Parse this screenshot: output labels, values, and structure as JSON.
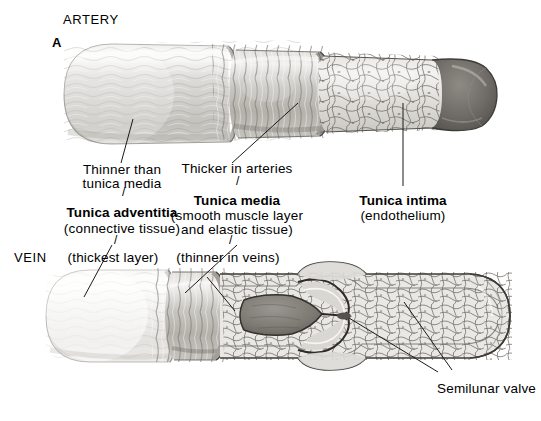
{
  "figure": {
    "panel_marker": "A",
    "title_artery": "ARTERY",
    "title_vein": "VEIN",
    "type": "anatomical-illustration",
    "background_color": "#ffffff",
    "ink_color": "#1a1a1a",
    "style": "grayscale pencil / airbrush medical illustration with cutaway sections"
  },
  "labels": {
    "adventitia_note": "Thinner than",
    "adventitia_note2": "tunica media",
    "adventitia_name": "Tunica adventitia",
    "adventitia_sub": "(connective tissue)",
    "adventitia_sub2": "(thickest layer)",
    "media_note": "Thicker in arteries",
    "media_name": "Tunica media",
    "media_sub": "(smooth muscle layer",
    "media_sub2": "and elastic tissue)",
    "media_sub3": "(thinner in veins)",
    "intima_name": "Tunica intima",
    "intima_sub": "(endothelium)",
    "valve_name": "Semilunar valve"
  },
  "structures": {
    "artery": {
      "layers": [
        "tunica adventitia",
        "tunica media",
        "tunica intima"
      ],
      "wall": "thick, muscular; tunica media is the thickest layer",
      "lumen": "round, narrow relative to wall thickness",
      "cut_end": "bevelled cutaway exposing concentric layers and endothelial lining"
    },
    "vein": {
      "layers": [
        "tunica adventitia",
        "tunica media",
        "tunica intima"
      ],
      "wall": "thin; tunica media much thinner than in arteries",
      "lumen": "wide, collapsible",
      "feature": "semilunar valve formed by two endothelial cusps within a dilated sinus"
    }
  },
  "leaders": {
    "count": 7,
    "description": "fine hairline pointers from caption text to the corresponding vessel layer"
  }
}
